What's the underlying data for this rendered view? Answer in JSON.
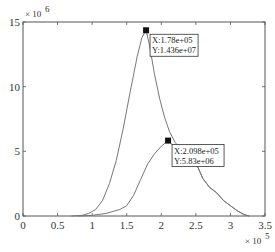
{
  "chart_data": {
    "type": "line",
    "title": "",
    "xlabel": "",
    "ylabel": "",
    "x_multiplier": "× 10^5",
    "y_multiplier": "× 10^6",
    "xlim": [
      0,
      3.5
    ],
    "ylim": [
      0,
      15
    ],
    "x_ticks": [
      "0",
      "0.5",
      "1",
      "1.5",
      "2",
      "2.5",
      "3",
      "3.5"
    ],
    "y_ticks": [
      "0",
      "5",
      "10",
      "15"
    ],
    "grid": false,
    "legend": null,
    "series": [
      {
        "name": "curve-1",
        "x": [
          0.7,
          0.85,
          0.95,
          1.05,
          1.15,
          1.25,
          1.35,
          1.45,
          1.55,
          1.65,
          1.72,
          1.78,
          1.83,
          1.9,
          1.98,
          2.05,
          2.12,
          2.2,
          2.3,
          2.4,
          2.45,
          2.52,
          2.6,
          2.7,
          2.8,
          2.9,
          3.0,
          3.1,
          3.2,
          3.27
        ],
        "y": [
          0.0,
          0.05,
          0.2,
          0.5,
          1.2,
          2.5,
          4.3,
          6.8,
          9.6,
          12.3,
          13.8,
          14.36,
          13.2,
          11.0,
          9.0,
          7.6,
          6.5,
          5.7,
          5.0,
          5.2,
          4.9,
          3.9,
          2.9,
          2.2,
          1.8,
          1.2,
          0.8,
          0.4,
          0.1,
          0.0
        ]
      },
      {
        "name": "curve-2",
        "x": [
          0.8,
          1.0,
          1.2,
          1.4,
          1.5,
          1.6,
          1.7,
          1.8,
          1.9,
          2.0,
          2.098,
          2.2,
          2.3,
          2.4,
          2.45,
          2.52,
          2.6,
          2.7,
          2.8,
          2.9,
          3.0,
          3.1,
          3.2,
          3.27
        ],
        "y": [
          0.0,
          0.05,
          0.2,
          0.5,
          0.8,
          1.6,
          2.8,
          4.0,
          4.8,
          5.4,
          5.83,
          5.3,
          4.6,
          4.8,
          4.7,
          3.9,
          2.9,
          2.2,
          1.8,
          1.2,
          0.8,
          0.4,
          0.1,
          0.0
        ]
      }
    ],
    "annotations": [
      {
        "x": 1.78,
        "y": 14.36,
        "line1": "X:1.78e+05",
        "line2": "Y:1.436e+07"
      },
      {
        "x": 2.098,
        "y": 5.83,
        "line1": "X:2.098e+05",
        "line2": "Y:5.83e+06"
      }
    ]
  },
  "colors": {
    "line": "#777777",
    "axis": "#555555",
    "marker": "#111111"
  }
}
